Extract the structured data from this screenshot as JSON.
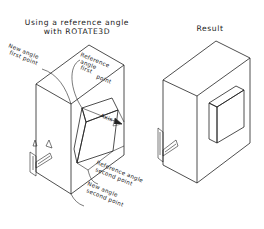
{
  "left_panel": {
    "title_line1": "Using a reference angle",
    "title_line2": "with ROTATE3D",
    "labels": {
      "new_angle_first": [
        "New angle",
        "first point"
      ],
      "reference_angle_first": [
        "Reference",
        "angle",
        "first",
        "point"
      ],
      "axis": "Axis",
      "reference_angle_second": [
        "Reference angle",
        "second point"
      ],
      "new_angle_second": [
        "New angle",
        "second point"
      ]
    }
  },
  "right_panel": {
    "title": "Result"
  },
  "colors": {
    "line": "#222222",
    "background": "#ffffff",
    "arrow_fill": "#222222"
  }
}
